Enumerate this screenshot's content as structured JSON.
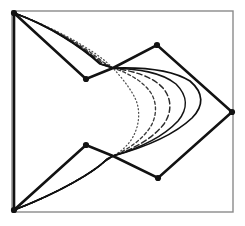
{
  "figure": {
    "canvas": {
      "width": 245,
      "height": 226,
      "background": "#ffffff"
    },
    "frame": {
      "label": "bounding frame",
      "x": 12,
      "y": 11,
      "width": 221,
      "height": 201,
      "stroke": "#8a8a8a",
      "stroke_width": 1.4
    },
    "control_polygon": {
      "label": "control polygon",
      "stroke": "#121212",
      "stroke_width": 2.6,
      "closed": true,
      "vertices": [
        {
          "name": "v0-top-left-corner",
          "x": 14,
          "y": 13
        },
        {
          "name": "v1-upper-valley",
          "x": 86,
          "y": 79
        },
        {
          "name": "v2-upper-junction",
          "x": 113,
          "y": 68
        },
        {
          "name": "v3-upper-peak",
          "x": 157,
          "y": 45
        },
        {
          "name": "v4-right-apex",
          "x": 232,
          "y": 112
        },
        {
          "name": "v5-lower-valley",
          "x": 158,
          "y": 178
        },
        {
          "name": "v6-lower-junction",
          "x": 113,
          "y": 156
        },
        {
          "name": "v7-lower-peak",
          "x": 86,
          "y": 145
        },
        {
          "name": "v8-bottom-left-corner",
          "x": 14,
          "y": 210
        }
      ],
      "marked_vertices": [
        {
          "name": "dot-top-left-corner",
          "x": 14,
          "y": 13,
          "r": 3.1
        },
        {
          "name": "dot-upper-valley",
          "x": 86,
          "y": 79,
          "r": 3.1
        },
        {
          "name": "dot-upper-peak",
          "x": 157,
          "y": 45,
          "r": 3.1
        },
        {
          "name": "dot-right-apex",
          "x": 232,
          "y": 112,
          "r": 3.1
        },
        {
          "name": "dot-lower-valley",
          "x": 158,
          "y": 178,
          "r": 3.1
        },
        {
          "name": "dot-lower-peak",
          "x": 86,
          "y": 145,
          "r": 3.1
        },
        {
          "name": "dot-bottom-left-corner",
          "x": 14,
          "y": 210,
          "r": 3.1
        }
      ],
      "vertex_color": "#121212"
    },
    "curve_family": {
      "label": "family of tension curves",
      "count": 5,
      "shared_start": {
        "x": 113,
        "y": 68
      },
      "shared_end": {
        "x": 113,
        "y": 156
      },
      "curves": [
        {
          "name": "curve-1-dotted-innermost",
          "style": "dotted",
          "dash_array": "1,2.6",
          "stroke": "#4f4f4f",
          "stroke_width": 1.25,
          "apex_x": 138,
          "d": "M 14,210 C 52,196 86,176 103,163 L 113,156 C 124,150 133,141 137,127 C 140,116 139,105 134,96 C 128,85 120,76 113,68 L 104,60 C 85,45 50,26 14,13"
        },
        {
          "name": "curve-2-dashed-fine",
          "style": "dashed-fine",
          "dash_array": "3,2.6",
          "stroke": "#3a3a3a",
          "stroke_width": 1.35,
          "apex_x": 155,
          "d": "M 14,210 C 54,195 89,175 104,162 L 113,156 C 129,149 143,139 151,126 C 157,115 157,103 151,93 C 143,81 128,73 113,68 L 103,62 C 84,46 50,26 14,13"
        },
        {
          "name": "curve-3-dashed-coarse",
          "style": "dashed-coarse",
          "dash_array": "5.5,3",
          "stroke": "#2a2a2a",
          "stroke_width": 1.45,
          "apex_x": 171,
          "d": "M 14,210 C 56,194 91,174 105,161 L 113,156 C 134,149 153,138 164,124 C 172,112 172,99 163,88 C 152,76 133,71 113,68 L 102,63 C 83,47 50,26 14,13"
        },
        {
          "name": "curve-4-solid-inner",
          "style": "solid",
          "dash_array": "none",
          "stroke": "#141414",
          "stroke_width": 1.55,
          "apex_x": 189,
          "d": "M 14,210 C 58,193 93,173 106,160 L 113,156 C 140,148 164,136 178,121 C 188,109 188,96 176,84 C 161,72 138,69 113,68 L 101,64 C 82,47 50,26 14,13"
        },
        {
          "name": "curve-5-solid-outer",
          "style": "solid",
          "dash_array": "none",
          "stroke": "#101010",
          "stroke_width": 1.7,
          "apex_x": 206,
          "d": "M 14,210 C 60,192 95,172 107,159 L 113,156 C 146,147 175,134 192,118 C 204,106 204,93 190,81 C 171,69 142,67 113,68 L 100,64 C 81,47 50,26 14,13"
        }
      ]
    }
  }
}
